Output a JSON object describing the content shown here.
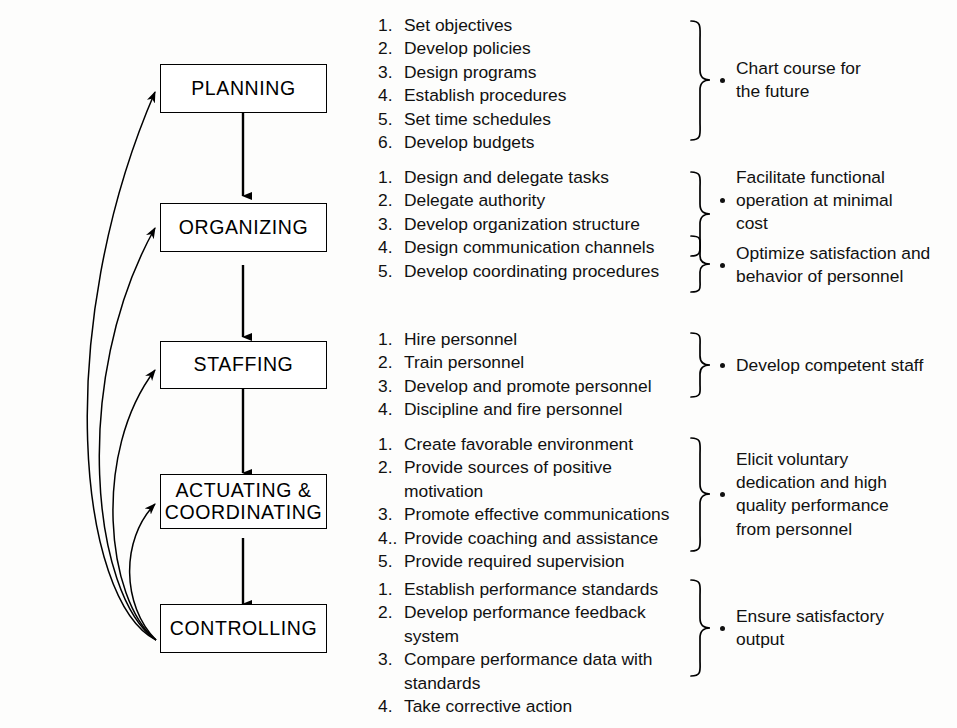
{
  "diagram": {
    "stages": [
      {
        "id": "planning",
        "label": "PLANNING",
        "label_line2": "",
        "tasks": [
          "Set objectives",
          "Develop policies",
          "Design programs",
          "Establish procedures",
          "Set time schedules",
          "Develop budgets"
        ],
        "task_numbers": [
          "1.",
          "2.",
          "3.",
          "4.",
          "5.",
          "6."
        ],
        "outcomes": [
          {
            "lines": [
              "Chart course for",
              "the future"
            ]
          }
        ]
      },
      {
        "id": "organizing",
        "label": "ORGANIZING",
        "label_line2": "",
        "tasks": [
          "Design and delegate tasks",
          "Delegate authority",
          "Develop organization structure",
          "Design communication channels",
          "Develop coordinating procedures"
        ],
        "task_numbers": [
          "1.",
          "2.",
          "3.",
          "4.",
          "5."
        ],
        "outcomes": [
          {
            "lines": [
              "Facilitate functional",
              "operation at minimal",
              "cost"
            ]
          },
          {
            "lines": [
              "Optimize satisfaction and",
              "behavior of personnel"
            ]
          }
        ]
      },
      {
        "id": "staffing",
        "label": "STAFFING",
        "label_line2": "",
        "tasks": [
          "Hire personnel",
          "Train personnel",
          "Develop and promote personnel",
          "Discipline and fire personnel"
        ],
        "task_numbers": [
          "1.",
          "2.",
          "3.",
          "4."
        ],
        "outcomes": [
          {
            "lines": [
              "Develop competent staff"
            ]
          }
        ]
      },
      {
        "id": "actuating-coordinating",
        "label": "ACTUATING &",
        "label_line2": "COORDINATING",
        "tasks": [
          "Create favorable environment",
          "Provide sources of positive",
          "motivation",
          "Promote effective communications",
          "Provide coaching and assistance",
          "Provide required supervision"
        ],
        "task_numbers": [
          "1.",
          "2.",
          "",
          "3.",
          "4..",
          "5."
        ],
        "outcomes": [
          {
            "lines": [
              "Elicit voluntary",
              "dedication and high",
              "quality performance",
              "from personnel"
            ]
          }
        ]
      },
      {
        "id": "controlling",
        "label": "CONTROLLING",
        "label_line2": "",
        "tasks": [
          "Establish performance standards",
          "Develop performance feedback",
          "system",
          "Compare performance data with",
          "standards",
          "Take corrective action"
        ],
        "task_numbers": [
          "1.",
          "2.",
          "",
          "3.",
          "",
          "4."
        ],
        "outcomes": [
          {
            "lines": [
              "Ensure satisfactory",
              "output"
            ]
          }
        ]
      }
    ],
    "colors": {
      "line": "#000000",
      "text": "#111111",
      "background": "#fdfdfc"
    }
  }
}
